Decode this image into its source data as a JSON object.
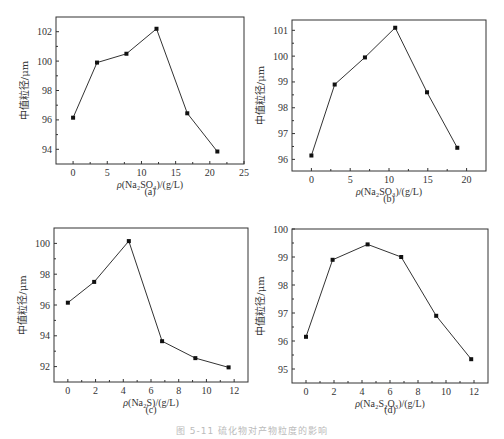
{
  "figure": {
    "caption": "图 5-11  硫化物对产物粒度的影响"
  },
  "chart_data": [
    {
      "id": "a",
      "type": "line",
      "subtitle": "(a)",
      "xlabel_prefix": "ρ",
      "xlabel": "(Na₂SO₄)/(g/L)",
      "ylabel": "中值粒径/μm",
      "x": [
        0,
        3.5,
        7.8,
        12.2,
        16.7,
        21.1
      ],
      "values": [
        96.15,
        99.9,
        100.5,
        102.2,
        96.45,
        93.85
      ],
      "xlim": [
        -2.5,
        25
      ],
      "ylim": [
        93,
        103
      ],
      "xticks": [
        0,
        5,
        10,
        15,
        20,
        25
      ],
      "yticks": [
        94,
        96,
        98,
        100,
        102
      ],
      "grid": false,
      "marker": "square"
    },
    {
      "id": "b",
      "type": "line",
      "subtitle": "(b)",
      "xlabel_prefix": "ρ",
      "xlabel": "(Na₂SO₃)/(g/L)",
      "ylabel": "中值粒径/μm",
      "x": [
        0,
        3.0,
        6.9,
        10.8,
        14.9,
        18.8
      ],
      "values": [
        96.15,
        98.9,
        99.95,
        101.1,
        98.6,
        96.45
      ],
      "xlim": [
        -2.5,
        22.5
      ],
      "ylim": [
        95.55,
        101.4
      ],
      "xticks": [
        0,
        5,
        10,
        15,
        20
      ],
      "yticks": [
        96,
        97,
        98,
        99,
        100,
        101
      ],
      "grid": false,
      "marker": "square"
    },
    {
      "id": "c",
      "type": "line",
      "subtitle": "(c)",
      "xlabel_prefix": "ρ",
      "xlabel": "(Na₂S)/(g/L)",
      "ylabel": "中值粒径/μm",
      "x": [
        0,
        1.9,
        4.4,
        6.8,
        9.2,
        11.6
      ],
      "values": [
        96.15,
        97.5,
        100.15,
        93.65,
        92.55,
        91.95
      ],
      "xlim": [
        -1,
        13
      ],
      "ylim": [
        91,
        101
      ],
      "xticks": [
        0,
        2,
        4,
        6,
        8,
        10,
        12
      ],
      "yticks": [
        92,
        94,
        96,
        98,
        100
      ],
      "grid": false,
      "marker": "square"
    },
    {
      "id": "d",
      "type": "line",
      "subtitle": "(d)",
      "xlabel_prefix": "ρ",
      "xlabel": "(Na₂S₂O₃)/(g/L)",
      "ylabel": "中值粒径/μm",
      "x": [
        0,
        1.9,
        4.4,
        6.8,
        9.3,
        11.8
      ],
      "values": [
        96.15,
        98.9,
        99.45,
        99.0,
        96.9,
        95.35
      ],
      "xlim": [
        -1,
        13
      ],
      "ylim": [
        94.5,
        100
      ],
      "xticks": [
        0,
        2,
        4,
        6,
        8,
        10,
        12
      ],
      "yticks": [
        95,
        96,
        97,
        98,
        99,
        100
      ],
      "grid": false,
      "marker": "square"
    }
  ],
  "layout": {
    "panels": [
      {
        "left": 56,
        "top": 17,
        "right": 244,
        "bottom": 164,
        "subtitle_y": 195
      },
      {
        "left": 292,
        "top": 20,
        "right": 486,
        "bottom": 171,
        "subtitle_y": 202
      },
      {
        "left": 54,
        "top": 228,
        "right": 248,
        "bottom": 382,
        "subtitle_y": 413
      },
      {
        "left": 292,
        "top": 229,
        "right": 488,
        "bottom": 383,
        "subtitle_y": 413
      }
    ],
    "line_color": "#333333"
  }
}
